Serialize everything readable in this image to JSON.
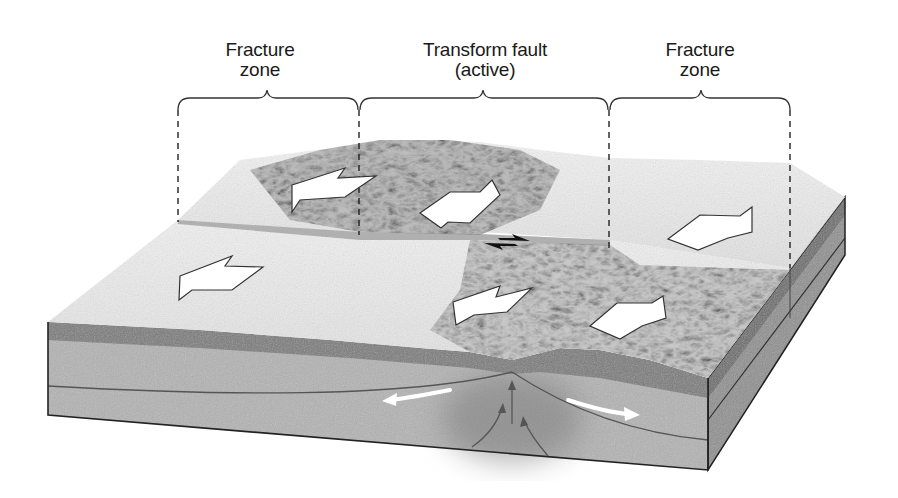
{
  "figure": {
    "topic": "Transform fault and fracture zones at an offset mid-ocean ridge",
    "labels": {
      "left_zone": {
        "line1": "Fracture",
        "line2": "zone"
      },
      "center_zone": {
        "line1": "Transform fault",
        "line2": "(active)"
      },
      "right_zone": {
        "line1": "Fracture",
        "line2": "zone"
      }
    },
    "brackets": [
      {
        "name": "left-fracture-zone-bracket",
        "x1": 178,
        "x2": 358
      },
      {
        "name": "transform-fault-bracket",
        "x1": 358,
        "x2": 608
      },
      {
        "name": "right-fracture-zone-bracket",
        "x1": 608,
        "x2": 790
      }
    ],
    "plate_motion_arrows": [
      {
        "name": "upper-left-plate-arrow",
        "direction": "left"
      },
      {
        "name": "upper-ridge-arrow",
        "direction": "right"
      },
      {
        "name": "upper-right-plate-arrow",
        "direction": "right"
      },
      {
        "name": "lower-left-plate-arrow",
        "direction": "left"
      },
      {
        "name": "lower-ridge-arrow-left",
        "direction": "left"
      },
      {
        "name": "lower-ridge-arrow-right",
        "direction": "right"
      }
    ],
    "transform_slip_arrows": {
      "upper": "right",
      "lower": "left"
    },
    "cross_section_arrows": {
      "left": "left",
      "right": "right",
      "upwelling": "up"
    },
    "colors": {
      "surface_light": "#eeeeee",
      "surface_ridge": "#9a9a9a",
      "crust_dark": "#7a7a7a",
      "lithosphere": "#b8b8b8",
      "asthenosphere": "#a9a9a9",
      "outline": "#222222"
    }
  }
}
